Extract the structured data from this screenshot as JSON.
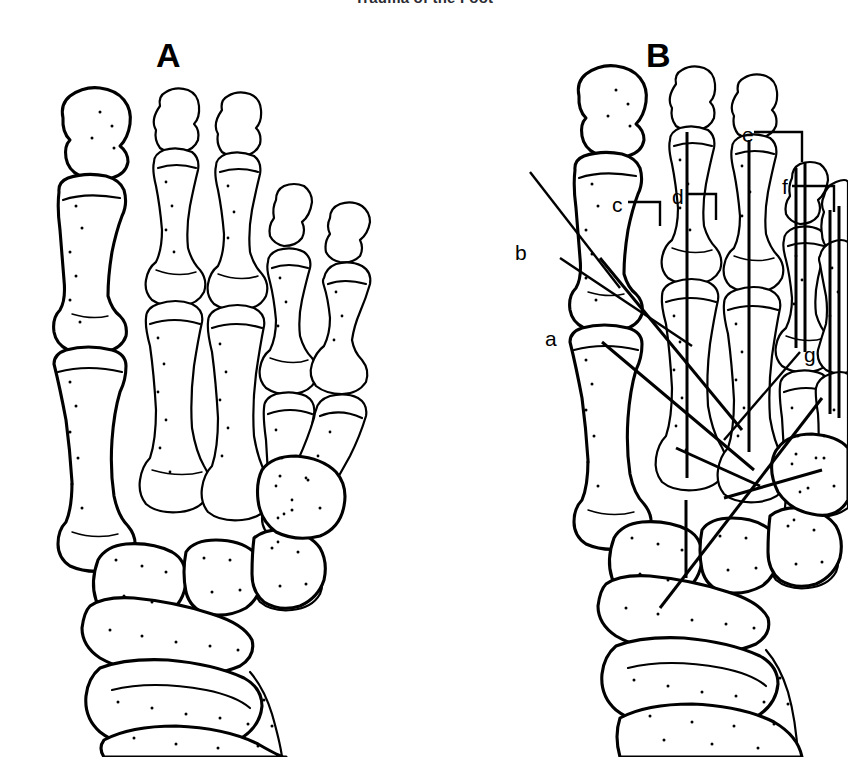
{
  "page": {
    "running_head": "Trauma of the Foot",
    "background_color": "#ffffff",
    "ink_color": "#000000",
    "width": 848,
    "height": 757
  },
  "figure": {
    "caption_letters": [
      "A",
      "B"
    ],
    "panels": [
      {
        "id": "A",
        "letter": "A",
        "description": "Dorsal view of foot skeleton showing injury pattern"
      },
      {
        "id": "B",
        "letter": "B",
        "description": "Dorsal view of foot skeleton with internal fixation wires"
      }
    ]
  },
  "callouts": [
    {
      "id": "a",
      "label": "a",
      "x": 545,
      "y": 328,
      "leader": "diagonal"
    },
    {
      "id": "b",
      "label": "b",
      "x": 515,
      "y": 242,
      "leader": "diagonal"
    },
    {
      "id": "c",
      "label": "c",
      "x": 612,
      "y": 194,
      "leader": "bracket"
    },
    {
      "id": "d",
      "label": "d",
      "x": 672,
      "y": 186,
      "leader": "bracket"
    },
    {
      "id": "e",
      "label": "e",
      "x": 742,
      "y": 124,
      "leader": "bracket"
    },
    {
      "id": "f",
      "label": "f",
      "x": 782,
      "y": 176,
      "leader": "bracket"
    },
    {
      "id": "g",
      "label": "g",
      "x": 804,
      "y": 344,
      "leader": "diagonal"
    }
  ]
}
